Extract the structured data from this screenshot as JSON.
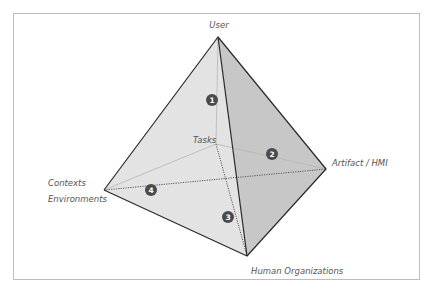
{
  "diagram": {
    "type": "tetrahedron",
    "vertices": {
      "user": {
        "label": "User",
        "x": 218,
        "y": 37
      },
      "tasks": {
        "label": "Tasks",
        "x": 216,
        "y": 144
      },
      "artifact": {
        "label": "Artifact / HMI",
        "x": 326,
        "y": 169
      },
      "contexts": {
        "label_line1": "Contexts",
        "label_line2": "Environments",
        "x": 104,
        "y": 190
      },
      "human_orgs": {
        "label": "Human Organizations",
        "x": 247,
        "y": 256
      }
    },
    "markers": [
      {
        "id": "1",
        "x": 212,
        "y": 100
      },
      {
        "id": "2",
        "x": 272,
        "y": 154
      },
      {
        "id": "3",
        "x": 228,
        "y": 217
      },
      {
        "id": "4",
        "x": 151,
        "y": 190
      }
    ],
    "colors": {
      "face_left": "#e4e4e4",
      "face_right": "#c6c6c6",
      "face_bottom": "#d6d6d6",
      "edge": "#2a2a2a",
      "hidden_edge": "#a8a8a8",
      "marker_fill": "#4a4a4a",
      "label": "#555555",
      "frame": "#bdbdbd"
    }
  }
}
